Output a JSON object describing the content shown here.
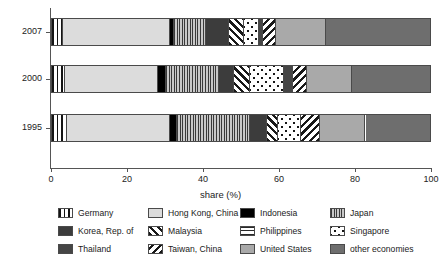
{
  "chart_data": {
    "type": "bar",
    "orientation": "horizontal",
    "stacked": true,
    "title": "",
    "xlabel": "share (%)",
    "ylabel": "year",
    "xlim": [
      0,
      100
    ],
    "xticks": [
      0,
      20,
      40,
      60,
      80,
      100
    ],
    "xtick_labels": [
      "0",
      "20",
      "40",
      "60",
      "80",
      "100"
    ],
    "grid": false,
    "legend_position": "bottom",
    "categories": [
      "2007",
      "2000",
      "1995"
    ],
    "series": [
      {
        "name": "Germany",
        "key": "germany",
        "pattern": "vertical-stripes",
        "values": [
          3.0,
          3.5,
          4.0
        ]
      },
      {
        "name": "Hong Kong, China",
        "key": "hongkong",
        "pattern": "light-gray-solid",
        "values": [
          28.0,
          24.5,
          27.0
        ]
      },
      {
        "name": "Indonesia",
        "key": "indonesia",
        "pattern": "black-solid",
        "values": [
          1.0,
          2.0,
          2.0
        ]
      },
      {
        "name": "Japan",
        "key": "japan",
        "pattern": "fine-vertical-stripes",
        "values": [
          8.5,
          14.0,
          13.0
        ]
      },
      {
        "name": "Korea, Rep. of",
        "key": "korea",
        "pattern": "dark-gray-solid",
        "values": [
          6.0,
          4.0,
          4.5
        ]
      },
      {
        "name": "Malaysia",
        "key": "malaysia",
        "pattern": "forward-diagonal",
        "values": [
          4.0,
          4.0,
          3.0
        ]
      },
      {
        "name": "Singapore",
        "key": "singapore",
        "pattern": "dots",
        "values": [
          4.0,
          9.0,
          6.0
        ]
      },
      {
        "name": "Thailand",
        "key": "thailand",
        "pattern": "mid-dark-gray-solid",
        "values": [
          1.0,
          2.5,
          0.0
        ]
      },
      {
        "name": "Taiwan, China",
        "key": "taiwan",
        "pattern": "back-diagonal",
        "values": [
          3.5,
          3.5,
          5.0
        ]
      },
      {
        "name": "United States",
        "key": "unitedstates",
        "pattern": "mid-gray-solid",
        "values": [
          13.0,
          12.0,
          12.0
        ]
      },
      {
        "name": "other economies",
        "key": "other",
        "pattern": "darker-gray-solid",
        "values": [
          28.0,
          21.0,
          23.5
        ]
      }
    ],
    "bars": [
      {
        "category": "2007",
        "segments": [
          {
            "key": "germany",
            "label": "Germany",
            "start": 0.0,
            "end": 3.0
          },
          {
            "key": "hongkong",
            "label": "Hong Kong, China",
            "start": 3.0,
            "end": 31.0
          },
          {
            "key": "indonesia",
            "label": "Indonesia",
            "start": 31.0,
            "end": 32.0
          },
          {
            "key": "japan",
            "label": "Japan",
            "start": 32.0,
            "end": 40.5
          },
          {
            "key": "korea",
            "label": "Korea, Rep. of",
            "start": 40.5,
            "end": 46.5
          },
          {
            "key": "malaysia",
            "label": "Malaysia",
            "start": 46.5,
            "end": 50.5
          },
          {
            "key": "singapore",
            "label": "Singapore",
            "start": 50.5,
            "end": 54.5
          },
          {
            "key": "thailand",
            "label": "Thailand",
            "start": 54.5,
            "end": 55.5
          },
          {
            "key": "taiwan",
            "label": "Taiwan, China",
            "start": 55.5,
            "end": 59.0
          },
          {
            "key": "unitedstates",
            "label": "United States",
            "start": 59.0,
            "end": 72.0
          },
          {
            "key": "other",
            "label": "other economies",
            "start": 72.0,
            "end": 100.0
          }
        ]
      },
      {
        "category": "2000",
        "segments": [
          {
            "key": "germany",
            "label": "Germany",
            "start": 0.0,
            "end": 3.5
          },
          {
            "key": "hongkong",
            "label": "Hong Kong, China",
            "start": 3.5,
            "end": 28.0
          },
          {
            "key": "indonesia",
            "label": "Indonesia",
            "start": 28.0,
            "end": 30.0
          },
          {
            "key": "japan",
            "label": "Japan",
            "start": 30.0,
            "end": 44.0
          },
          {
            "key": "korea",
            "label": "Korea, Rep. of",
            "start": 44.0,
            "end": 48.0
          },
          {
            "key": "malaysia",
            "label": "Malaysia",
            "start": 48.0,
            "end": 52.0
          },
          {
            "key": "singapore",
            "label": "Singapore",
            "start": 52.0,
            "end": 61.0
          },
          {
            "key": "thailand",
            "label": "Thailand",
            "start": 61.0,
            "end": 63.5
          },
          {
            "key": "taiwan",
            "label": "Taiwan, China",
            "start": 63.5,
            "end": 67.0
          },
          {
            "key": "unitedstates",
            "label": "United States",
            "start": 67.0,
            "end": 79.0
          },
          {
            "key": "other",
            "label": "other economies",
            "start": 79.0,
            "end": 100.0
          }
        ]
      },
      {
        "category": "1995",
        "segments": [
          {
            "key": "germany",
            "label": "Germany",
            "start": 0.0,
            "end": 4.0
          },
          {
            "key": "hongkong",
            "label": "Hong Kong, China",
            "start": 4.0,
            "end": 31.0
          },
          {
            "key": "indonesia",
            "label": "Indonesia",
            "start": 31.0,
            "end": 33.0
          },
          {
            "key": "japan",
            "label": "Japan",
            "start": 33.0,
            "end": 52.0
          },
          {
            "key": "korea",
            "label": "Korea, Rep. of",
            "start": 52.0,
            "end": 56.5
          },
          {
            "key": "malaysia",
            "label": "Malaysia",
            "start": 56.5,
            "end": 59.5
          },
          {
            "key": "singapore",
            "label": "Singapore",
            "start": 59.5,
            "end": 65.5
          },
          {
            "key": "taiwan",
            "label": "Taiwan, China",
            "start": 65.5,
            "end": 70.5
          },
          {
            "key": "unitedstates",
            "label": "United States",
            "start": 70.5,
            "end": 82.5
          },
          {
            "key": "other",
            "label": "other economies",
            "start": 82.5,
            "end": 100.0
          }
        ]
      }
    ],
    "legend_columns": [
      [
        {
          "key": "germany",
          "label": "Germany"
        },
        {
          "key": "korea",
          "label": "Korea, Rep. of"
        },
        {
          "key": "thailand",
          "label": "Thailand"
        }
      ],
      [
        {
          "key": "hongkong",
          "label": "Hong Kong, China"
        },
        {
          "key": "malaysia",
          "label": "Malaysia"
        },
        {
          "key": "taiwan",
          "label": "Taiwan, China"
        }
      ],
      [
        {
          "key": "indonesia",
          "label": "Indonesia"
        },
        {
          "key": "philippines",
          "label": "Philippines"
        },
        {
          "key": "unitedstates",
          "label": "United States"
        }
      ],
      [
        {
          "key": "japan",
          "label": "Japan"
        },
        {
          "key": "singapore",
          "label": "Singapore"
        },
        {
          "key": "other",
          "label": "other economies"
        }
      ]
    ]
  }
}
